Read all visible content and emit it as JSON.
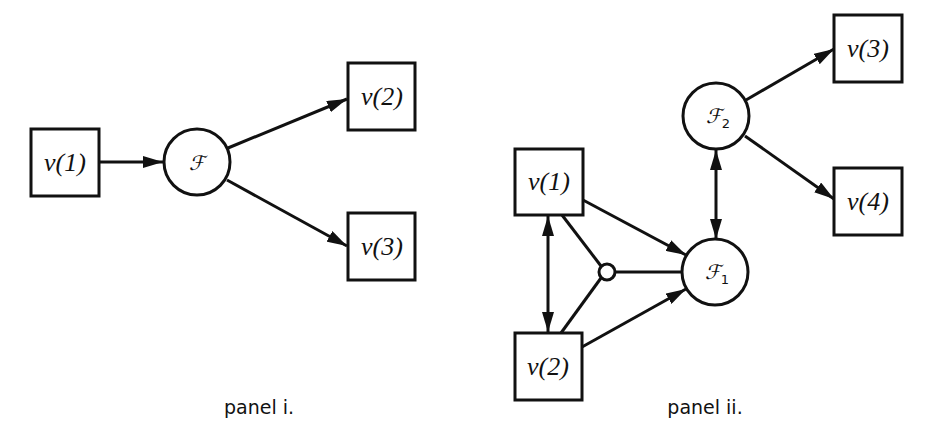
{
  "panels": [
    {
      "caption": "panel i.",
      "variables": [
        {
          "id": "p1-v1",
          "label": "v(1)"
        },
        {
          "id": "p1-v2",
          "label": "v(2)"
        },
        {
          "id": "p1-v3",
          "label": "v(3)"
        }
      ],
      "functions": [
        {
          "id": "p1-F",
          "symbol": "ℱ",
          "subscript": ""
        }
      ],
      "edges": [
        {
          "from": "v(1)",
          "to": "ℱ",
          "type": "arrow"
        },
        {
          "from": "ℱ",
          "to": "v(2)",
          "type": "arrow"
        },
        {
          "from": "ℱ",
          "to": "v(3)",
          "type": "arrow"
        }
      ]
    },
    {
      "caption": "panel ii.",
      "variables": [
        {
          "id": "p2-v1",
          "label": "v(1)"
        },
        {
          "id": "p2-v2",
          "label": "v(2)"
        },
        {
          "id": "p2-v3",
          "label": "v(3)"
        },
        {
          "id": "p2-v4",
          "label": "v(4)"
        }
      ],
      "functions": [
        {
          "id": "p2-F1",
          "symbol": "ℱ",
          "subscript": "1"
        },
        {
          "id": "p2-F2",
          "symbol": "ℱ",
          "subscript": "2"
        }
      ],
      "junction": {
        "id": "p2-junction",
        "shape": "small-circle"
      },
      "edges": [
        {
          "from": "v(1)",
          "to": "ℱ1",
          "type": "arrow"
        },
        {
          "from": "v(2)",
          "to": "ℱ1",
          "type": "arrow"
        },
        {
          "from": "v(1)",
          "to": "v(2)",
          "type": "double-arrow"
        },
        {
          "from": "v(1)",
          "to": "junction",
          "type": "line"
        },
        {
          "from": "v(2)",
          "to": "junction",
          "type": "line"
        },
        {
          "from": "junction",
          "to": "ℱ1",
          "type": "line"
        },
        {
          "from": "ℱ1",
          "to": "ℱ2",
          "type": "double-arrow"
        },
        {
          "from": "ℱ2",
          "to": "v(3)",
          "type": "arrow"
        },
        {
          "from": "ℱ2",
          "to": "v(4)",
          "type": "arrow"
        }
      ]
    }
  ]
}
